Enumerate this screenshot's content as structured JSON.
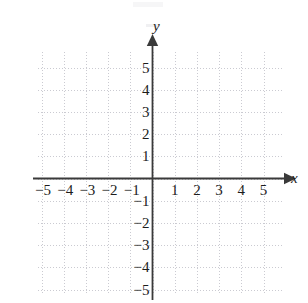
{
  "figure": {
    "kind": "cartesian-coordinate-plane",
    "width": 308,
    "height": 303,
    "background_color": "#ffffff"
  },
  "axes": {
    "x_axis_label": "x",
    "y_axis_label": "y",
    "axis_color": "#3a3a3a",
    "grid_color": "#b9b9c2",
    "label_color": "#1c1c1c",
    "grid_style": "dotted",
    "has_arrowheads": true
  },
  "chart_data": {
    "type": "scatter",
    "title": "",
    "xlabel": "x",
    "ylabel": "y",
    "xlim": [
      -5.5,
      5.6
    ],
    "ylim": [
      -5.5,
      5.6
    ],
    "xticks": [
      -5,
      -4,
      -3,
      -2,
      -1,
      1,
      2,
      3,
      4,
      5
    ],
    "yticks": [
      5,
      4,
      3,
      2,
      1,
      -1,
      -2,
      -3,
      -4,
      -5
    ],
    "xtick_labels": [
      "−5",
      "−4",
      "−3",
      "−2",
      "−1",
      "1",
      "2",
      "3",
      "4",
      "5"
    ],
    "ytick_labels": [
      "5",
      "4",
      "3",
      "2",
      "1",
      "−1",
      "−2",
      "−3",
      "−4",
      "−5"
    ],
    "grid": true,
    "legend": null,
    "series": [],
    "points": [],
    "annotations": []
  },
  "x_ticks": [
    {
      "value": -5,
      "label": "−5"
    },
    {
      "value": -4,
      "label": "−4"
    },
    {
      "value": -3,
      "label": "−3"
    },
    {
      "value": -2,
      "label": "−2"
    },
    {
      "value": -1,
      "label": "−1"
    },
    {
      "value": 1,
      "label": "1"
    },
    {
      "value": 2,
      "label": "2"
    },
    {
      "value": 3,
      "label": "3"
    },
    {
      "value": 4,
      "label": "4"
    },
    {
      "value": 5,
      "label": "5"
    }
  ],
  "y_ticks": [
    {
      "value": 5,
      "label": "5"
    },
    {
      "value": 4,
      "label": "4"
    },
    {
      "value": 3,
      "label": "3"
    },
    {
      "value": 2,
      "label": "2"
    },
    {
      "value": 1,
      "label": "1"
    },
    {
      "value": -1,
      "label": "−1"
    },
    {
      "value": -2,
      "label": "−2"
    },
    {
      "value": -3,
      "label": "−3"
    },
    {
      "value": -4,
      "label": "−4"
    },
    {
      "value": -5,
      "label": "−5"
    }
  ]
}
